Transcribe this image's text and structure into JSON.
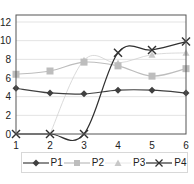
{
  "chart_data": {
    "type": "line",
    "title": "",
    "xlabel": "",
    "ylabel": "",
    "x": [
      1,
      2,
      3,
      4,
      5,
      6
    ],
    "ylim": [
      0,
      12
    ],
    "yticks": [
      0,
      2,
      4,
      6,
      8,
      10,
      12
    ],
    "xticks": [
      1,
      2,
      3,
      4,
      5,
      6
    ],
    "grid": "horizontal",
    "legend_position": "bottom",
    "series": [
      {
        "name": "P1",
        "marker": "diamond",
        "color": "#404040",
        "values": [
          4.9,
          4.4,
          4.3,
          4.7,
          4.7,
          4.4
        ]
      },
      {
        "name": "P2",
        "marker": "square",
        "color": "#bdbdbd",
        "values": [
          6.4,
          6.75,
          7.7,
          7.3,
          6.2,
          7.0
        ]
      },
      {
        "name": "P3",
        "marker": "triangle",
        "color": "#d0d0d0",
        "values": [
          null,
          0,
          7.9,
          7.6,
          8.5,
          8.7
        ]
      },
      {
        "name": "P4",
        "marker": "x",
        "color": "#303030",
        "values": [
          0,
          0,
          0,
          8.7,
          9.0,
          9.9
        ]
      }
    ]
  },
  "legend": {
    "items": [
      {
        "label": "P1"
      },
      {
        "label": "P2"
      },
      {
        "label": "P3"
      },
      {
        "label": "P4"
      }
    ]
  }
}
